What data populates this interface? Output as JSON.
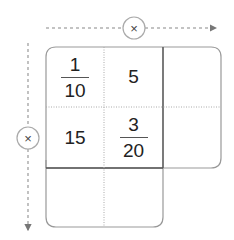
{
  "diagram": {
    "type": "multiplication-grid",
    "column_operator": "×",
    "row_operator": "×",
    "cells": [
      {
        "row": 0,
        "col": 0,
        "kind": "fraction",
        "numerator": "1",
        "denominator": "10"
      },
      {
        "row": 0,
        "col": 1,
        "kind": "number",
        "value": "5"
      },
      {
        "row": 1,
        "col": 0,
        "kind": "number",
        "value": "15"
      },
      {
        "row": 1,
        "col": 1,
        "kind": "fraction",
        "numerator": "3",
        "denominator": "20"
      }
    ],
    "empty_cells": [
      "row0-col2",
      "row1-col2",
      "row2-col0",
      "row2-col1"
    ],
    "colors": {
      "line": "#888888",
      "dark_line": "#555555",
      "dotted": "#aaaaaa",
      "text": "#222222"
    }
  }
}
